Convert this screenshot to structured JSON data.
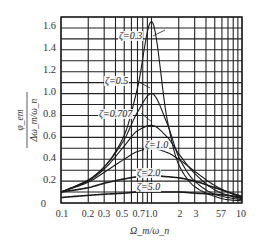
{
  "chart_data": {
    "type": "line",
    "title": "",
    "xlabel": "Ω_m/ω_n",
    "ylabel": "φ_em / (Δω_m/ω_n)",
    "xscale": "log",
    "xlim": [
      0.1,
      10
    ],
    "ylim": [
      0,
      1.7
    ],
    "grid": true,
    "legend": "inline annotations",
    "x_ticks": [
      "0.1",
      "0.2",
      "0.3",
      "0.5",
      "0.7",
      "1.0",
      "2",
      "3",
      "5",
      "7",
      "10"
    ],
    "y_ticks": [
      "0",
      "0.2",
      "0.4",
      "0.6",
      "0.8",
      "1.0",
      "1.2",
      "1.4",
      "1.6"
    ],
    "x": [
      0.1,
      0.2,
      0.3,
      0.5,
      0.7,
      1.0,
      1.5,
      2,
      3,
      5,
      7,
      10
    ],
    "series": [
      {
        "name": "ζ=0.3",
        "values": [
          0.1,
          0.21,
          0.33,
          0.62,
          1.05,
          1.66,
          0.75,
          0.35,
          0.15,
          0.06,
          0.03,
          0.02
        ]
      },
      {
        "name": "ζ=0.5",
        "values": [
          0.1,
          0.21,
          0.33,
          0.58,
          0.83,
          1.0,
          0.72,
          0.42,
          0.2,
          0.08,
          0.05,
          0.03
        ]
      },
      {
        "name": "ζ=0.707",
        "values": [
          0.1,
          0.2,
          0.31,
          0.52,
          0.66,
          0.71,
          0.6,
          0.45,
          0.27,
          0.12,
          0.07,
          0.04
        ]
      },
      {
        "name": "ζ=1.0",
        "values": [
          0.1,
          0.19,
          0.28,
          0.4,
          0.47,
          0.5,
          0.46,
          0.4,
          0.29,
          0.16,
          0.1,
          0.05
        ]
      },
      {
        "name": "ζ=2.0",
        "values": [
          0.1,
          0.14,
          0.18,
          0.22,
          0.24,
          0.25,
          0.24,
          0.23,
          0.2,
          0.14,
          0.1,
          0.06
        ]
      },
      {
        "name": "ζ=5.0",
        "values": [
          0.05,
          0.07,
          0.08,
          0.09,
          0.1,
          0.1,
          0.1,
          0.1,
          0.09,
          0.08,
          0.07,
          0.05
        ]
      }
    ]
  },
  "labels": {
    "xlabel": "Ω_m/ω_n",
    "ylabel_num": "φ_em",
    "ylabel_den": "Δω_m/ω_n",
    "annotations": [
      "ζ=0.3",
      "ζ=0.5",
      "ζ=0.707",
      "ζ=1.0",
      "ζ=2.0",
      "ζ=5.0"
    ],
    "y_ticks": [
      "1.6",
      "1.4",
      "1.2",
      "1.0",
      "0.8",
      "0.6",
      "0.4",
      "0.2",
      "0"
    ],
    "x_ticks": [
      "0.1",
      "0.2",
      "0.3",
      "0.5",
      "0.71.0",
      "2",
      "3",
      "57",
      "10"
    ]
  },
  "colors": {
    "grid": "#222222",
    "curve": "#1a1a1a",
    "text": "#333333"
  }
}
